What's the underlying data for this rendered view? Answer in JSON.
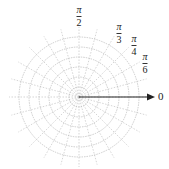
{
  "diagram": {
    "type": "polar_grid",
    "center": {
      "x": 79,
      "y": 97
    },
    "circle_count": 6,
    "circle_spacing": 10,
    "spoke_angle_step_deg": 15,
    "spoke_length": 70,
    "grid_color": "#b8b8b8",
    "axis_color": "#222222",
    "polar_axis": {
      "label": "0",
      "arrow_tip_x": 155
    },
    "angle_labels": [
      {
        "id": "pi-over-2",
        "numerator": "π",
        "denominator": "2",
        "x": 79,
        "y": 5
      },
      {
        "id": "pi-over-3",
        "numerator": "π",
        "denominator": "3",
        "x": 119,
        "y": 22
      },
      {
        "id": "pi-over-4",
        "numerator": "π",
        "denominator": "4",
        "x": 134,
        "y": 34
      },
      {
        "id": "pi-over-6",
        "numerator": "π",
        "denominator": "6",
        "x": 145,
        "y": 52
      }
    ]
  }
}
